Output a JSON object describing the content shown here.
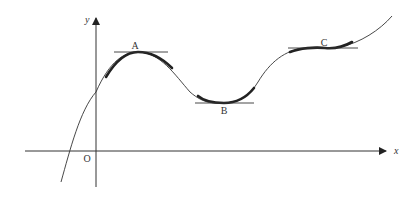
{
  "diagram": {
    "type": "function-graph-stationary-points",
    "axes": {
      "x_label": "x",
      "y_label": "y",
      "origin_label": "O"
    },
    "points": [
      {
        "label": "A",
        "kind": "local maximum"
      },
      {
        "label": "B",
        "kind": "local minimum"
      },
      {
        "label": "C",
        "kind": "stationary point of inflection"
      }
    ],
    "colors": {
      "stroke": "#222222",
      "axis": "#333333",
      "background": "#ffffff"
    }
  }
}
